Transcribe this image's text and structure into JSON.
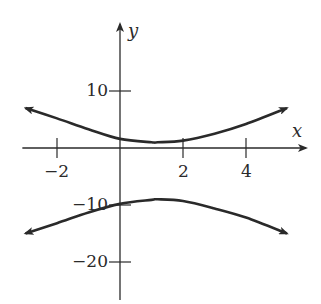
{
  "chart_data": {
    "type": "line",
    "title": "",
    "xlabel": "x",
    "ylabel": "y",
    "x_ticks": [
      -2,
      2,
      4
    ],
    "x_tick_labels": [
      "−2",
      "2",
      "4"
    ],
    "y_ticks": [
      10,
      -10,
      -20
    ],
    "y_tick_labels": [
      "10",
      "−10",
      "−20"
    ],
    "xlim": [
      -3.1,
      5.8
    ],
    "ylim": [
      -26,
      21
    ],
    "grid": false,
    "legend": "none",
    "curve_description": "Hyperbola opening up and down (two branches), center near (1.2, -4), vertices near (1.2, 1) and (1.2, -9), both branches with arrowheads at both ends",
    "series": [
      {
        "name": "upper-branch",
        "x": [
          -3,
          -2,
          -1,
          0,
          1,
          1.2,
          2,
          3,
          4,
          5.3
        ],
        "y": [
          7,
          5.2,
          3.3,
          1.6,
          1.0,
          1.0,
          1.3,
          2.5,
          4.2,
          7
        ]
      },
      {
        "name": "lower-branch",
        "x": [
          -3,
          -2,
          -1,
          0,
          1,
          1.2,
          2,
          3,
          4,
          5.3
        ],
        "y": [
          -15,
          -13.2,
          -11.3,
          -9.8,
          -9.1,
          -9.0,
          -9.3,
          -10.6,
          -12.2,
          -15
        ]
      }
    ],
    "colors": {
      "curve": "#2a2a2a",
      "axis": "#2a2a2a"
    }
  }
}
